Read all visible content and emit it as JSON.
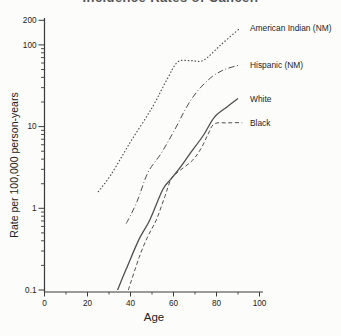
{
  "window": {
    "clipped_title": "Incidence Rates of Cancer."
  },
  "chart_data": {
    "type": "line",
    "title_partially_cut_off": true,
    "xlabel": "Age",
    "ylabel": "Rate per 100,000 person-years",
    "x_scale": "linear",
    "y_scale": "log",
    "xlim": [
      0,
      100
    ],
    "ylim": [
      0.1,
      200
    ],
    "grid": false,
    "x_ticks": [
      0,
      20,
      40,
      60,
      80,
      100
    ],
    "x_minor_ticks": [
      10,
      30,
      50,
      70,
      90
    ],
    "y_ticks": [
      [
        200,
        "200"
      ],
      [
        100,
        "100"
      ],
      [
        10,
        "10"
      ],
      [
        1,
        "1"
      ],
      [
        0.1,
        "0.1"
      ]
    ],
    "y_minor_decades": [
      0.1,
      1,
      10
    ],
    "legend_position": "labels-at-line-ends-right",
    "line_color": "#4f4f4f",
    "axis_color": "#3a3a3a",
    "series": [
      {
        "name": "American Indian (NM)",
        "style": "dotted",
        "points": [
          [
            25,
            1.6
          ],
          [
            31,
            2.6
          ],
          [
            40,
            6.5
          ],
          [
            50,
            17
          ],
          [
            57,
            38
          ],
          [
            62,
            62
          ],
          [
            68,
            64
          ],
          [
            74,
            65
          ],
          [
            82,
            100
          ],
          [
            91,
            161
          ]
        ]
      },
      {
        "name": "Hispanic (NM)",
        "style": "dashdot",
        "points": [
          [
            38,
            0.65
          ],
          [
            43,
            1.2
          ],
          [
            48,
            2.7
          ],
          [
            54,
            4.6
          ],
          [
            60,
            8.6
          ],
          [
            68,
            21
          ],
          [
            76,
            37
          ],
          [
            83,
            49
          ],
          [
            91,
            57
          ]
        ]
      },
      {
        "name": "White",
        "style": "solid",
        "points": [
          [
            34,
            0.1
          ],
          [
            38,
            0.18
          ],
          [
            44,
            0.42
          ],
          [
            49,
            0.72
          ],
          [
            55,
            1.7
          ],
          [
            59,
            2.3
          ],
          [
            64,
            3.4
          ],
          [
            68,
            4.8
          ],
          [
            74,
            7.9
          ],
          [
            79,
            13
          ],
          [
            85,
            17.5
          ],
          [
            90,
            22
          ]
        ]
      },
      {
        "name": "Black",
        "style": "dashed",
        "points": [
          [
            39,
            0.1
          ],
          [
            44,
            0.25
          ],
          [
            48,
            0.45
          ],
          [
            52,
            0.72
          ],
          [
            56,
            1.4
          ],
          [
            59,
            2.3
          ],
          [
            63,
            2.9
          ],
          [
            69,
            3.9
          ],
          [
            73,
            5.5
          ],
          [
            76,
            8
          ],
          [
            79,
            10.8
          ],
          [
            85,
            11.1
          ],
          [
            92,
            11.2
          ]
        ]
      }
    ]
  }
}
